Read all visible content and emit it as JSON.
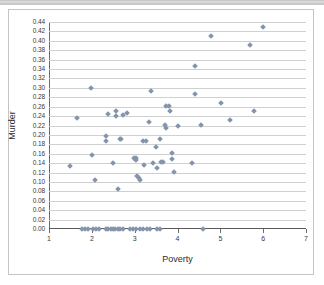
{
  "chart_data": {
    "type": "scatter",
    "title": "",
    "xlabel": "Poverty",
    "ylabel": "Murder",
    "xlim": [
      1,
      7
    ],
    "ylim": [
      0.0,
      0.44
    ],
    "grid": "horizontal",
    "legend": "none",
    "marker": {
      "shape": "diamond",
      "color": "#8494ac",
      "size_px": 4
    },
    "xticks": [
      "1",
      "2",
      "3",
      "4",
      "5",
      "6",
      "7"
    ],
    "yticks": [
      "0.00",
      "0.02",
      "0.04",
      "0.06",
      "0.08",
      "0.10",
      "0.12",
      "0.14",
      "0.16",
      "0.18",
      "0.20",
      "0.22",
      "0.24",
      "0.26",
      "0.28",
      "0.30",
      "0.32",
      "0.34",
      "0.36",
      "0.38",
      "0.40",
      "0.42",
      "0.44"
    ],
    "points": [
      [
        1.48,
        0.134
      ],
      [
        1.66,
        0.237
      ],
      [
        1.98,
        0.3
      ],
      [
        2.0,
        0.157
      ],
      [
        2.08,
        0.105
      ],
      [
        2.32,
        0.197
      ],
      [
        2.33,
        0.187
      ],
      [
        2.37,
        0.245
      ],
      [
        2.56,
        0.251
      ],
      [
        2.57,
        0.24
      ],
      [
        2.5,
        0.14
      ],
      [
        2.62,
        0.084
      ],
      [
        2.66,
        0.192
      ],
      [
        2.69,
        0.191
      ],
      [
        2.72,
        0.243
      ],
      [
        2.81,
        0.246
      ],
      [
        2.98,
        0.15
      ],
      [
        3.0,
        0.149
      ],
      [
        3.02,
        0.151
      ],
      [
        3.04,
        0.147
      ],
      [
        3.06,
        0.112
      ],
      [
        3.09,
        0.108
      ],
      [
        3.12,
        0.105
      ],
      [
        3.2,
        0.188
      ],
      [
        3.26,
        0.188
      ],
      [
        3.22,
        0.135
      ],
      [
        3.33,
        0.227
      ],
      [
        3.38,
        0.293
      ],
      [
        3.42,
        0.141
      ],
      [
        3.5,
        0.174
      ],
      [
        3.52,
        0.13
      ],
      [
        3.58,
        0.191
      ],
      [
        3.62,
        0.143
      ],
      [
        3.66,
        0.142
      ],
      [
        3.7,
        0.221
      ],
      [
        3.72,
        0.214
      ],
      [
        3.74,
        0.262
      ],
      [
        3.79,
        0.261
      ],
      [
        3.82,
        0.25
      ],
      [
        3.86,
        0.161
      ],
      [
        3.88,
        0.148
      ],
      [
        3.92,
        0.121
      ],
      [
        4.02,
        0.218
      ],
      [
        4.35,
        0.14
      ],
      [
        4.4,
        0.288
      ],
      [
        4.42,
        0.346
      ],
      [
        4.55,
        0.222
      ],
      [
        4.79,
        0.411
      ],
      [
        5.02,
        0.268
      ],
      [
        5.22,
        0.232
      ],
      [
        5.7,
        0.391
      ],
      [
        5.78,
        0.251
      ],
      [
        5.99,
        0.429
      ],
      [
        1.78,
        0.0
      ],
      [
        1.84,
        0.0
      ],
      [
        1.9,
        0.0
      ],
      [
        2.02,
        0.0
      ],
      [
        2.1,
        0.0
      ],
      [
        2.16,
        0.0
      ],
      [
        2.32,
        0.0
      ],
      [
        2.38,
        0.0
      ],
      [
        2.44,
        0.0
      ],
      [
        2.5,
        0.0
      ],
      [
        2.55,
        0.0
      ],
      [
        2.6,
        0.0
      ],
      [
        2.66,
        0.0
      ],
      [
        2.72,
        0.0
      ],
      [
        2.9,
        0.0
      ],
      [
        2.97,
        0.0
      ],
      [
        3.04,
        0.0
      ],
      [
        3.12,
        0.0
      ],
      [
        3.2,
        0.0
      ],
      [
        3.28,
        0.0
      ],
      [
        3.36,
        0.0
      ],
      [
        3.52,
        0.0
      ],
      [
        3.6,
        0.0
      ],
      [
        4.6,
        0.0
      ]
    ]
  },
  "axes": {
    "x_title": "Poverty",
    "y_title": "Murder"
  }
}
